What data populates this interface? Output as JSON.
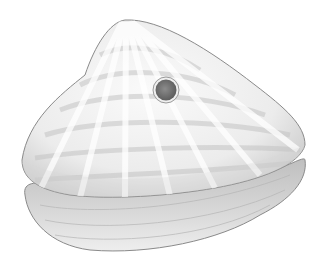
{
  "image": {
    "subject": "shell-illustration",
    "description": "Pencil drawing of a bivalve clam shell with a small bored hole near the umbo",
    "colors": {
      "background": "#ffffff",
      "shell_light": "#f2f2f2",
      "shell_mid": "#d6d6d6",
      "shell_band": "#bdbdbd",
      "outline": "#8a8a8a",
      "hole_dark": "#6e6e6e",
      "hole_rim": "#e8e8e8"
    }
  }
}
